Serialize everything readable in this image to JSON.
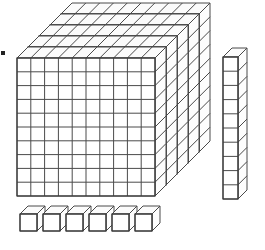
{
  "figure": {
    "line_color": "#4a4a4a",
    "fill_color": "#ffffff",
    "background_color": "#ffffff"
  },
  "blocks": {
    "flats": {
      "name": "hundreds-flats",
      "count": 5,
      "grid_rows": 10,
      "grid_cols": 10,
      "value_each": 100,
      "value_total": 500,
      "front_left": 17,
      "front_top": 58,
      "cell": 13.8,
      "depth_dx": 11,
      "depth_dy": -11
    },
    "rod": {
      "name": "tens-rod",
      "count": 1,
      "segments": 10,
      "value_each": 10,
      "value_total": 10,
      "left": 223,
      "top": 57,
      "cell_w": 15,
      "cell_h": 14.2,
      "depth_dx": 9,
      "depth_dy": -9
    },
    "units": {
      "name": "ones-cubes",
      "count": 6,
      "value_each": 1,
      "value_total": 6,
      "first_left": 20,
      "top": 214,
      "cube": 17,
      "spacing": 23,
      "depth_dx": 8,
      "depth_dy": -8
    },
    "total_value": 516
  },
  "marks": {
    "corner_dot": {
      "name": "corner-mark",
      "color": "#222222"
    }
  }
}
